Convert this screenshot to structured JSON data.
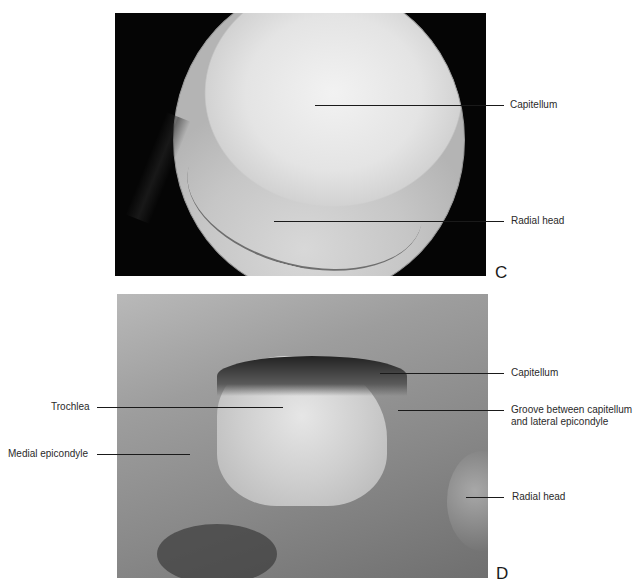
{
  "figure": {
    "panels": [
      {
        "id": "C",
        "letter": "C",
        "image": "arthroscopic view of elbow joint",
        "labels": [
          {
            "text": "Capitellum"
          },
          {
            "text": "Radial head"
          }
        ]
      },
      {
        "id": "D",
        "letter": "D",
        "image": "anatomic specimen of distal humerus",
        "labels": [
          {
            "text": "Capitellum"
          },
          {
            "text": "Trochlea"
          },
          {
            "text": "Groove between capitellum\nand lateral epicondyle",
            "line1": "Groove between capitellum",
            "line2": "and lateral epicondyle"
          },
          {
            "text": "Medial epicondyle"
          },
          {
            "text": "Radial head"
          }
        ]
      }
    ]
  }
}
